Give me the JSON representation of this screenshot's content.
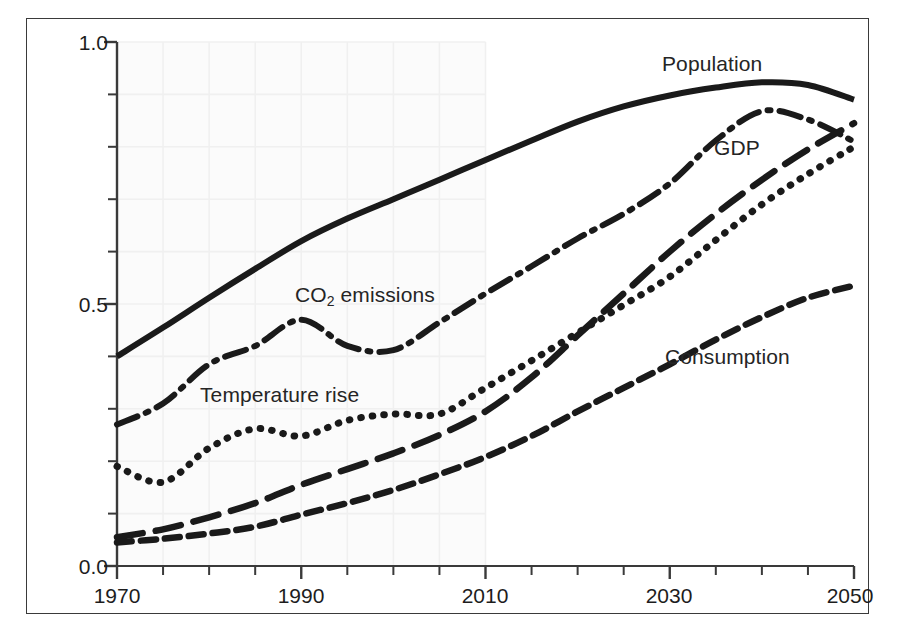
{
  "chart_data": {
    "type": "line",
    "title": "",
    "xlabel": "",
    "ylabel": "",
    "xlim": [
      1970,
      2050
    ],
    "ylim": [
      0.0,
      1.0
    ],
    "grid": true,
    "grid_region": {
      "x_start": 1970,
      "x_end": 2010,
      "note": "light grid shading over historical period"
    },
    "legend_position": "inline-labels",
    "x_tick_labels": [
      "1970",
      "1990",
      "2010",
      "2030",
      "2050"
    ],
    "x_tick_values": [
      1970,
      1990,
      2010,
      2030,
      2050
    ],
    "x_minor_tick_step": 5,
    "y_tick_labels": [
      "0.0",
      "0.5",
      "1.0"
    ],
    "y_tick_values": [
      0.0,
      0.5,
      1.0
    ],
    "y_minor_tick_step": 0.1,
    "x": [
      1970,
      1975,
      1980,
      1985,
      1990,
      1995,
      2000,
      2005,
      2010,
      2015,
      2020,
      2025,
      2030,
      2035,
      2040,
      2045,
      2050
    ],
    "series": [
      {
        "name": "Population",
        "style": "solid",
        "label_x": 2030,
        "label_y": 0.965,
        "values": [
          0.4,
          0.455,
          0.512,
          0.567,
          0.62,
          0.663,
          0.7,
          0.737,
          0.775,
          0.812,
          0.848,
          0.877,
          0.898,
          0.913,
          0.923,
          0.918,
          0.89
        ]
      },
      {
        "name": "CO2 emissions",
        "style": "dash-dot",
        "label_x": 1996,
        "label_y": 0.513,
        "values": [
          0.27,
          0.31,
          0.385,
          0.42,
          0.47,
          0.42,
          0.412,
          0.465,
          0.52,
          0.572,
          0.625,
          0.672,
          0.73,
          0.812,
          0.868,
          0.852,
          0.81
        ]
      },
      {
        "name": "Temperature rise",
        "style": "dotted",
        "label_x": 1987,
        "label_y": 0.305,
        "values": [
          0.19,
          0.16,
          0.225,
          0.262,
          0.248,
          0.278,
          0.29,
          0.29,
          0.34,
          0.392,
          0.445,
          0.498,
          0.552,
          0.622,
          0.69,
          0.748,
          0.8
        ]
      },
      {
        "name": "GDP",
        "style": "long-dash",
        "label_x": 2036,
        "label_y": 0.79,
        "values": [
          0.055,
          0.07,
          0.093,
          0.12,
          0.155,
          0.185,
          0.215,
          0.25,
          0.295,
          0.36,
          0.44,
          0.52,
          0.6,
          0.672,
          0.737,
          0.795,
          0.845
        ]
      },
      {
        "name": "Consumption",
        "style": "dash",
        "label_x": 2033,
        "label_y": 0.395,
        "values": [
          0.045,
          0.052,
          0.062,
          0.075,
          0.098,
          0.12,
          0.145,
          0.175,
          0.208,
          0.248,
          0.295,
          0.34,
          0.385,
          0.432,
          0.475,
          0.512,
          0.535
        ]
      }
    ],
    "colors": {
      "line": "#1a1a1a",
      "axis": "#3a3a3a",
      "grid": "#f0f0f0",
      "grid_fill": "#fbfbfb",
      "text": "#1d1d1d",
      "frame": "#3a3a3a"
    }
  },
  "axis": {
    "y_labels": [
      {
        "text": "1.0",
        "value": 1.0
      },
      {
        "text": "0.5",
        "value": 0.5
      },
      {
        "text": "0.0",
        "value": 0.0
      }
    ],
    "x_labels": [
      {
        "text": "1970",
        "value": 1970
      },
      {
        "text": "1990",
        "value": 1990
      },
      {
        "text": "2010",
        "value": 2010
      },
      {
        "text": "2030",
        "value": 2030
      },
      {
        "text": "2050",
        "value": 2050
      }
    ]
  },
  "labels": {
    "population": "Population",
    "co2_prefix": "CO",
    "co2_sub": "2",
    "co2_suffix": " emissions",
    "temperature": "Temperature rise",
    "gdp": "GDP",
    "consumption": "Consumption"
  }
}
